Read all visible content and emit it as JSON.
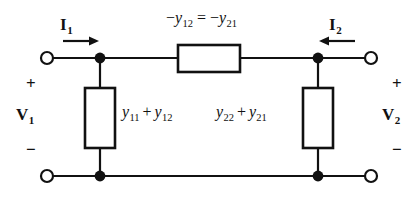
{
  "figure": {
    "name": "two-port-pi-equivalent-circuit",
    "background_color": "#ffffff",
    "ink_color": "#111111"
  },
  "labels": {
    "current_left": {
      "symbol": "I",
      "subscript": "1"
    },
    "current_right": {
      "symbol": "I",
      "subscript": "2"
    },
    "voltage_left": {
      "symbol": "V",
      "subscript": "1"
    },
    "voltage_right": {
      "symbol": "V",
      "subscript": "2"
    },
    "series_branch": {
      "minus1": "−",
      "sym1": "y",
      "sub1": "12",
      "equals": "=",
      "minus2": "−",
      "sym2": "y",
      "sub2": "21"
    },
    "shunt_left": {
      "sym1": "y",
      "sub1": "11",
      "plus": "+",
      "sym2": "y",
      "sub2": "12"
    },
    "shunt_right": {
      "sym1": "y",
      "sub1": "22",
      "plus": "+",
      "sym2": "y",
      "sub2": "21"
    },
    "polarity": {
      "plus": "+",
      "minus": "−"
    }
  },
  "elements": {
    "series_element_name": "series-impedance-box",
    "shunt_left_name": "left-shunt-impedance-box",
    "shunt_right_name": "right-shunt-impedance-box",
    "terminals": [
      "top-left-terminal",
      "top-right-terminal",
      "bottom-left-terminal",
      "bottom-right-terminal"
    ],
    "nodes": [
      "top-left-node",
      "top-right-node",
      "bottom-left-node",
      "bottom-right-node"
    ],
    "arrows": [
      "current-arrow-i1",
      "current-arrow-i2"
    ]
  }
}
